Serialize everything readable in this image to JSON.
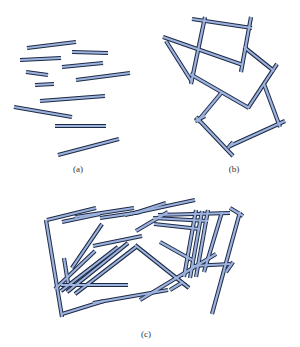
{
  "colors": {
    "stick_fill": "#9db3de",
    "stick_outline": "#1d2a44",
    "background": "#ffffff",
    "caption": "#333333"
  },
  "stick_style": {
    "outline_width": 4.2,
    "fill_width": 2.2
  },
  "panels": [
    {
      "id": "a",
      "caption": "(a)",
      "caption_pos": [
        78,
        164
      ],
      "description": "Disconnected sticks, roughly horizontal",
      "sticks": [
        [
          27,
          48,
          76,
          42
        ],
        [
          72,
          52,
          108,
          53
        ],
        [
          20,
          60,
          61,
          58
        ],
        [
          62,
          67,
          103,
          63
        ],
        [
          26,
          72,
          48,
          75
        ],
        [
          76,
          80,
          130,
          73
        ],
        [
          35,
          85,
          54,
          84
        ],
        [
          40,
          101,
          105,
          96
        ],
        [
          14,
          107,
          72,
          117
        ],
        [
          55,
          126,
          106,
          126
        ],
        [
          58,
          155,
          119,
          139
        ]
      ]
    },
    {
      "id": "b",
      "caption": "(b)",
      "caption_pos": [
        234,
        164
      ],
      "description": "Connected network of sticks forming closed loops",
      "sticks": [
        [
          192,
          19,
          252,
          28
        ],
        [
          205,
          17,
          191,
          84
        ],
        [
          163,
          37,
          243,
          65
        ],
        [
          166,
          41,
          192,
          82
        ],
        [
          251,
          17,
          241,
          72
        ],
        [
          244,
          47,
          274,
          71
        ],
        [
          277,
          64,
          248,
          108
        ],
        [
          190,
          74,
          249,
          108
        ],
        [
          222,
          92,
          197,
          122
        ],
        [
          196,
          117,
          233,
          156
        ],
        [
          230,
          146,
          285,
          121
        ],
        [
          264,
          84,
          280,
          127
        ],
        [
          195,
          121,
          205,
          116
        ],
        [
          228,
          148,
          233,
          142
        ]
      ]
    },
    {
      "id": "c",
      "caption": "(c)",
      "caption_pos": [
        146,
        329
      ],
      "description": "Dense stick network with parallel overlapping bundles",
      "sticks": [
        [
          47,
          220,
          96,
          208
        ],
        [
          62,
          222,
          100,
          214
        ],
        [
          75,
          217,
          134,
          208
        ],
        [
          100,
          218,
          141,
          212
        ],
        [
          125,
          215,
          195,
          200
        ],
        [
          135,
          213,
          166,
          203
        ],
        [
          46,
          220,
          62,
          317
        ],
        [
          64,
          258,
          68,
          283
        ],
        [
          102,
          224,
          72,
          268
        ],
        [
          93,
          246,
          142,
          236
        ],
        [
          136,
          231,
          168,
          212
        ],
        [
          158,
          215,
          230,
          213
        ],
        [
          240,
          212,
          212,
          314
        ],
        [
          230,
          208,
          243,
          216
        ],
        [
          153,
          218,
          208,
          221
        ],
        [
          154,
          224,
          200,
          229
        ],
        [
          196,
          210,
          184,
          277
        ],
        [
          202,
          211,
          190,
          278
        ],
        [
          208,
          210,
          196,
          277
        ],
        [
          222,
          212,
          204,
          272
        ],
        [
          192,
          266,
          230,
          264
        ],
        [
          216,
          254,
          140,
          300
        ],
        [
          95,
          251,
          55,
          289
        ],
        [
          160,
          242,
          192,
          260
        ],
        [
          135,
          245,
          189,
          288
        ],
        [
          128,
          243,
          67,
          292
        ],
        [
          136,
          247,
          75,
          294
        ],
        [
          118,
          247,
          61,
          291
        ],
        [
          61,
          285,
          128,
          285
        ],
        [
          62,
          314,
          104,
          301
        ],
        [
          93,
          303,
          168,
          290
        ],
        [
          170,
          290,
          183,
          282
        ],
        [
          226,
          272,
          233,
          262
        ]
      ]
    }
  ]
}
